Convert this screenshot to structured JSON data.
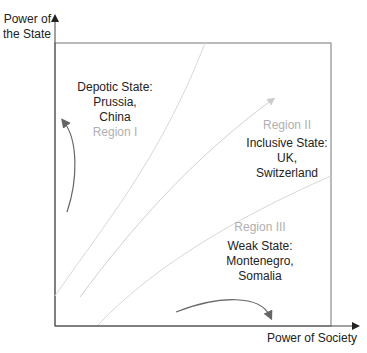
{
  "axes": {
    "y_label_line1": "Power of",
    "y_label_line2": "the State",
    "x_label": "Power of Society"
  },
  "regions": [
    {
      "id": "I",
      "label": "Region I",
      "title": "Depotic State:",
      "examples_line1": "Prussia,",
      "examples_line2": "China"
    },
    {
      "id": "II",
      "label": "Region II",
      "title": "Inclusive State:",
      "examples_line1": "UK,",
      "examples_line2": "Switzerland"
    },
    {
      "id": "III",
      "label": "Region III",
      "title": "Weak State:",
      "examples_line1": "Montenegro,",
      "examples_line2": "Somalia"
    }
  ],
  "colors": {
    "axis": "#555555",
    "boundary_lines": "#d8d8d8",
    "arrows": "#666666",
    "region_label": "#b0b0b0"
  }
}
